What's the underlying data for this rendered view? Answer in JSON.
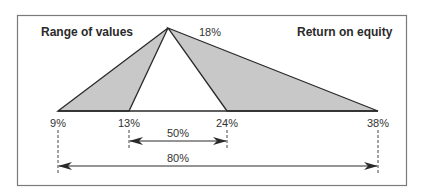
{
  "diagram": {
    "title_left": "Range of values",
    "title_right": "Return on equity",
    "peak_label": "18%",
    "axis_points": [
      {
        "label": "9%",
        "value": 9
      },
      {
        "label": "13%",
        "value": 13
      },
      {
        "label": "24%",
        "value": 24
      },
      {
        "label": "38%",
        "value": 38
      }
    ],
    "ranges": [
      {
        "label": "50%",
        "from": "13%",
        "to": "24%"
      },
      {
        "label": "80%",
        "from": "9%",
        "to": "38%"
      }
    ],
    "colors": {
      "fill": "#c8c8c8",
      "stroke": "#2a2a2a",
      "frame": "#7a7a7a",
      "background": "#ffffff"
    }
  }
}
